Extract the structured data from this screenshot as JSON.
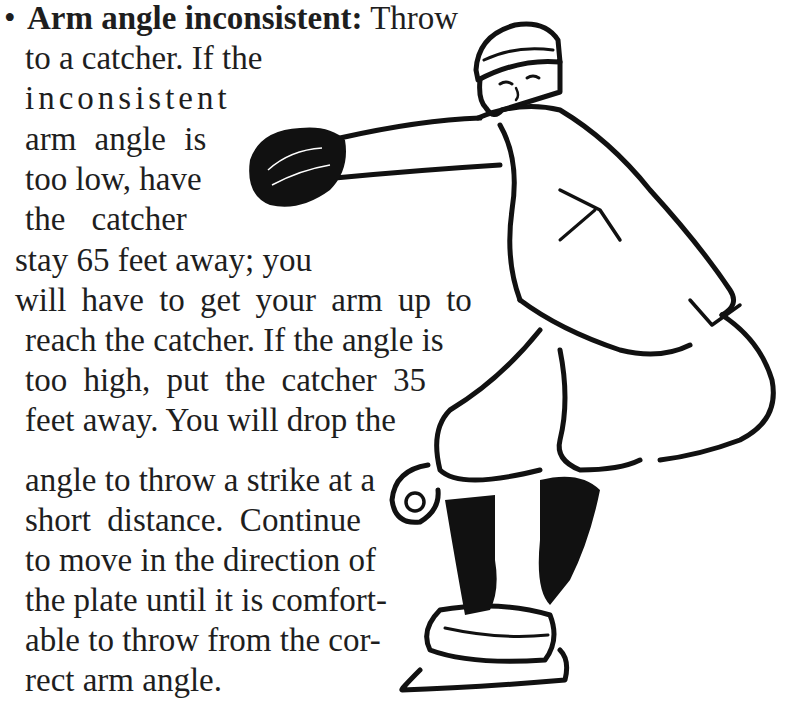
{
  "document": {
    "bullet_symbol": "•",
    "item": {
      "term": "Arm angle inconsistent:",
      "lines": [
        " Throw",
        "to a catcher. If the",
        "inconsistent",
        "arm angle is",
        "too low, have",
        "the catcher",
        "stay 65 feet away; you",
        "will have to get your arm up to",
        "reach the catcher. If the angle is",
        "too high, put the catcher 35",
        "feet away. You will drop the",
        "angle to throw a strike at a",
        "short distance. Continue",
        "to move in the direction of",
        "the plate until it is comfort-",
        "able to throw from the cor-",
        "rect arm angle."
      ]
    },
    "illustration": {
      "subject": "baseball pitcher in throwing stance with glove extended",
      "ink_color": "#111111",
      "paper_color": "#ffffff"
    }
  }
}
